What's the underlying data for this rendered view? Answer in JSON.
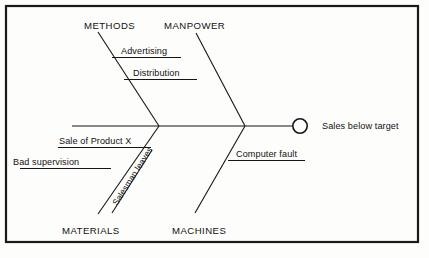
{
  "diagram": {
    "type": "fishbone-ishikawa-cause-and-effect",
    "effect": {
      "label": "Sales below target",
      "node_shape": "circle"
    },
    "categories": [
      {
        "id": "methods",
        "label": "METHODS",
        "position": "top-left"
      },
      {
        "id": "manpower",
        "label": "MANPOWER",
        "position": "top-right"
      },
      {
        "id": "materials",
        "label": "MATERIALS",
        "position": "bottom-left"
      },
      {
        "id": "machines",
        "label": "MACHINES",
        "position": "bottom-right"
      }
    ],
    "causes": [
      {
        "id": "advertising",
        "label": "Advertising",
        "category": "methods"
      },
      {
        "id": "distribution",
        "label": "Distribution",
        "category": "methods"
      },
      {
        "id": "sale-of-product-x",
        "label": "Sale of Product X",
        "category": "materials"
      },
      {
        "id": "bad-supervision",
        "label": "Bad supervision",
        "category": "materials"
      },
      {
        "id": "salesman-leaves",
        "label": "Salesman leaves",
        "category": "materials",
        "orientation": "diagonal"
      },
      {
        "id": "computer-fault",
        "label": "Computer fault",
        "category": "machines"
      }
    ],
    "colors": {
      "line": "#151515",
      "frame": "#1a1a1a",
      "text": "#111111",
      "background": "#fdfdfc"
    }
  }
}
